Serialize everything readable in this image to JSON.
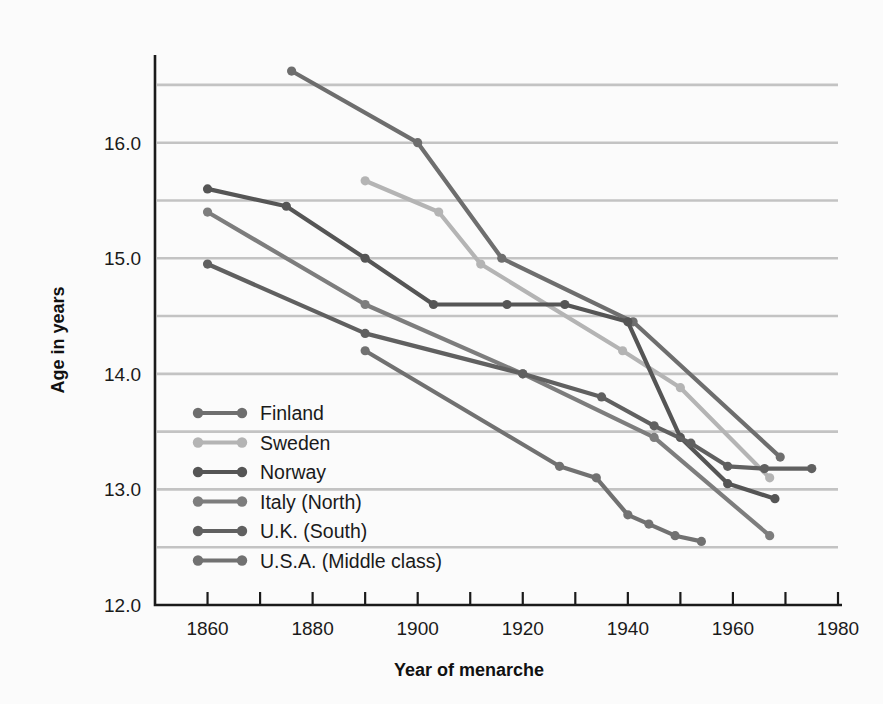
{
  "chart_data": {
    "type": "line",
    "title": "",
    "xlabel": "Year of menarche",
    "ylabel": "Age in years",
    "xlim": [
      1850,
      1980
    ],
    "ylim": [
      12.0,
      16.75
    ],
    "xticks": [
      1860,
      1880,
      1900,
      1920,
      1940,
      1960,
      1980
    ],
    "xtick_labels": [
      "1860",
      "1880",
      "1900",
      "1920",
      "1940",
      "1960",
      "1980"
    ],
    "xminor_step": 10,
    "yticks": [
      12.0,
      13.0,
      14.0,
      15.0,
      16.0
    ],
    "ytick_labels": [
      "12.0",
      "13.0",
      "14.0",
      "15.0",
      "16.0"
    ],
    "ygridlines": [
      12.5,
      13.0,
      13.5,
      14.0,
      14.5,
      15.0,
      15.5,
      16.0,
      16.5
    ],
    "grid": true,
    "grid_color": "#c3c3c3",
    "legend_position": "inside-lower-left",
    "series": [
      {
        "name": "Finland",
        "color": "#6e6e6e",
        "x": [
          1876,
          1900,
          1916,
          1941,
          1969
        ],
        "y": [
          16.62,
          16.0,
          15.0,
          14.45,
          13.28
        ]
      },
      {
        "name": "Sweden",
        "color": "#b4b4b4",
        "x": [
          1890,
          1904,
          1912,
          1939,
          1950,
          1967
        ],
        "y": [
          15.67,
          15.4,
          14.95,
          14.2,
          13.88,
          13.1
        ]
      },
      {
        "name": "Norway",
        "color": "#555555",
        "x": [
          1860,
          1875,
          1890,
          1903,
          1917,
          1928,
          1940,
          1950,
          1959,
          1968
        ],
        "y": [
          15.6,
          15.45,
          15.0,
          14.6,
          14.6,
          14.6,
          14.45,
          13.45,
          13.05,
          12.92
        ]
      },
      {
        "name": "Italy (North)",
        "color": "#7d7d7d",
        "x": [
          1860,
          1890,
          1920,
          1945,
          1967
        ],
        "y": [
          15.4,
          14.6,
          14.0,
          13.45,
          12.6
        ]
      },
      {
        "name": "U.K. (South)",
        "color": "#606060",
        "x": [
          1860,
          1890,
          1920,
          1935,
          1945,
          1952,
          1959,
          1966,
          1975
        ],
        "y": [
          14.95,
          14.35,
          14.0,
          13.8,
          13.55,
          13.4,
          13.2,
          13.18,
          13.18
        ]
      },
      {
        "name": "U.S.A. (Middle class)",
        "color": "#717171",
        "x": [
          1890,
          1927,
          1934,
          1940,
          1944,
          1949,
          1954
        ],
        "y": [
          14.2,
          13.2,
          13.1,
          12.78,
          12.7,
          12.6,
          12.55
        ]
      }
    ]
  },
  "legend": {
    "items": [
      {
        "label": "Finland",
        "color": "#6e6e6e"
      },
      {
        "label": "Sweden",
        "color": "#b4b4b4"
      },
      {
        "label": "Norway",
        "color": "#555555"
      },
      {
        "label": "Italy (North)",
        "color": "#7d7d7d"
      },
      {
        "label": "U.K. (South)",
        "color": "#606060"
      },
      {
        "label": "U.S.A. (Middle class)",
        "color": "#717171"
      }
    ]
  }
}
